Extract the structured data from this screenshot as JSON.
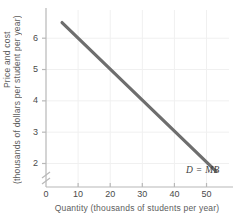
{
  "chart_data": {
    "type": "line",
    "title": "",
    "xlabel": "Quantity (thousands of students per year)",
    "ylabel_line1": "Price and cost",
    "ylabel_line2": "(thousands of dollars per student per year)",
    "xlim": [
      0,
      57
    ],
    "ylim": [
      1.25,
      6.9
    ],
    "xticks": [
      "0",
      "10",
      "20",
      "30",
      "40",
      "50"
    ],
    "xtick_values": [
      0,
      10,
      20,
      30,
      40,
      50
    ],
    "yticks": [
      "2",
      "3",
      "4",
      "5",
      "6"
    ],
    "ytick_values": [
      2,
      3,
      4,
      5,
      6
    ],
    "y_axis_break": true,
    "y_axis_break_symbol": "axis-break-slashes",
    "grid": true,
    "legend_position": "inline-right",
    "series": [
      {
        "name": "D = MB",
        "label": "D = MB",
        "color": "#6e6e6e",
        "x": [
          5,
          53
        ],
        "y": [
          6.5,
          1.75
        ],
        "points": [
          [
            5,
            6.5
          ],
          [
            10,
            6.0
          ],
          [
            20,
            5.0
          ],
          [
            30,
            4.0
          ],
          [
            40,
            3.0
          ],
          [
            50,
            2.05
          ],
          [
            53,
            1.75
          ]
        ]
      }
    ],
    "annotations": [
      {
        "text": "D = MB",
        "x": 48,
        "y": 1.45,
        "style": "italic"
      }
    ]
  },
  "colors": {
    "curve": "#6e6e6e",
    "axis": "#b8b8b8",
    "grid": "#f0f0f0",
    "tick_text": "#4a4a4a",
    "label_text": "#5c5c5c",
    "background": "#ffffff"
  }
}
